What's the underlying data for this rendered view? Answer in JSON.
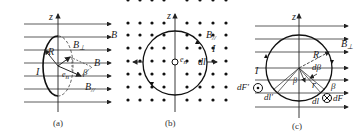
{
  "figure": {
    "panels": [
      {
        "id": "a",
        "caption": "(a)",
        "labels": {
          "z": "z",
          "B": "B",
          "B_perp": "B",
          "B_perp_sub": "⊥",
          "R": "R",
          "I": "I",
          "B_vec": "B",
          "beta": "β",
          "e_n": "e",
          "e_n_sub": "n",
          "B_par": "B",
          "B_par_sub": "//"
        }
      },
      {
        "id": "b",
        "caption": "(b)",
        "labels": {
          "z": "z",
          "B_par": "B",
          "B_par_sub": "//",
          "I": "I",
          "e_n": "e",
          "e_n_sub": "n",
          "dl": "dl"
        }
      },
      {
        "id": "c",
        "caption": "(c)",
        "labels": {
          "z": "z",
          "B_perp": "B",
          "B_perp_sub": "⊥",
          "R": "R",
          "I": "I",
          "dbeta": "dβ",
          "beta_inner": "β",
          "r": "r",
          "beta_outer": "β",
          "dF_prime": "dF′",
          "dl_prime": "dl′",
          "dl": "dl",
          "dF": "dF"
        }
      }
    ],
    "colors": {
      "ink": "#222222",
      "background": "#ffffff"
    }
  }
}
